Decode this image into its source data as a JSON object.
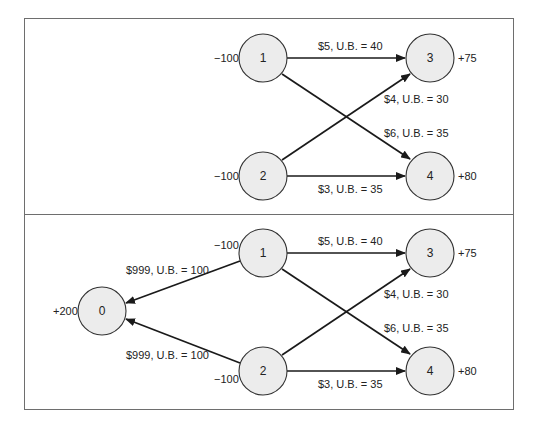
{
  "diagram": {
    "type": "network-flow",
    "panels": [
      {
        "id": "original",
        "nodes": [
          {
            "id": "1",
            "label": "1",
            "supply": "−100"
          },
          {
            "id": "2",
            "label": "2",
            "supply": "−100"
          },
          {
            "id": "3",
            "label": "3",
            "supply": "+75"
          },
          {
            "id": "4",
            "label": "4",
            "supply": "+80"
          }
        ],
        "edges": [
          {
            "from": "1",
            "to": "3",
            "label": "$5, U.B. = 40"
          },
          {
            "from": "2",
            "to": "3",
            "label": "$4, U.B. = 30"
          },
          {
            "from": "1",
            "to": "4",
            "label": "$6, U.B. = 35"
          },
          {
            "from": "2",
            "to": "4",
            "label": "$3, U.B. = 35"
          }
        ]
      },
      {
        "id": "with-dummy",
        "nodes": [
          {
            "id": "0",
            "label": "0",
            "supply": "+200"
          },
          {
            "id": "1",
            "label": "1",
            "supply": "−100"
          },
          {
            "id": "2",
            "label": "2",
            "supply": "−100"
          },
          {
            "id": "3",
            "label": "3",
            "supply": "+75"
          },
          {
            "id": "4",
            "label": "4",
            "supply": "+80"
          }
        ],
        "edges": [
          {
            "from": "1",
            "to": "0",
            "label": "$999, U.B. = 100"
          },
          {
            "from": "2",
            "to": "0",
            "label": "$999, U.B. = 100"
          },
          {
            "from": "1",
            "to": "3",
            "label": "$5, U.B. = 40"
          },
          {
            "from": "2",
            "to": "3",
            "label": "$4, U.B. = 30"
          },
          {
            "from": "1",
            "to": "4",
            "label": "$6, U.B. = 35"
          },
          {
            "from": "2",
            "to": "4",
            "label": "$3, U.B. = 35"
          }
        ]
      }
    ]
  }
}
